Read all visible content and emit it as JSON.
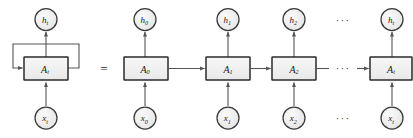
{
  "figure": {
    "background_color": "#ffffff",
    "equals_sign": "=",
    "ellipsis": "···",
    "colors": {
      "node_fill": "#eeeeee",
      "node_stroke": "#3a3a3a",
      "box_fill": "#f0f0f0",
      "box_stroke": "#2b2b2b",
      "arrow": "#555555",
      "text": "#1a1a1a"
    }
  },
  "folded": {
    "name": "folded-rnn",
    "output": {
      "base": "h",
      "subscript": "t",
      "full": "h_t"
    },
    "cell": {
      "base": "A",
      "subscript": "t",
      "full": "A_t"
    },
    "input": {
      "base": "x",
      "subscript": "t",
      "full": "x_t"
    },
    "self_loop": "recurrent-loop"
  },
  "unrolled": {
    "name": "unrolled-rnn",
    "steps": [
      {
        "output": {
          "base": "h",
          "subscript": "0",
          "full": "h_0"
        },
        "cell": {
          "base": "A",
          "subscript": "0",
          "full": "A_0"
        },
        "input": {
          "base": "x",
          "subscript": "0",
          "full": "x_0"
        }
      },
      {
        "output": {
          "base": "h",
          "subscript": "1",
          "full": "h_1"
        },
        "cell": {
          "base": "A",
          "subscript": "1",
          "full": "A_1"
        },
        "input": {
          "base": "x",
          "subscript": "1",
          "full": "x_1"
        }
      },
      {
        "output": {
          "base": "h",
          "subscript": "2",
          "full": "h_2"
        },
        "cell": {
          "base": "A",
          "subscript": "2",
          "full": "A_2"
        },
        "input": {
          "base": "x",
          "subscript": "2",
          "full": "x_2"
        }
      },
      {
        "output": {
          "base": "h",
          "subscript": "t",
          "full": "h_t"
        },
        "cell": {
          "base": "A",
          "subscript": "t",
          "full": "A_t"
        },
        "input": {
          "base": "x",
          "subscript": "t",
          "full": "x_t"
        }
      }
    ],
    "gap_dots": {
      "top": "···",
      "middle": "···",
      "bottom": "···"
    }
  }
}
